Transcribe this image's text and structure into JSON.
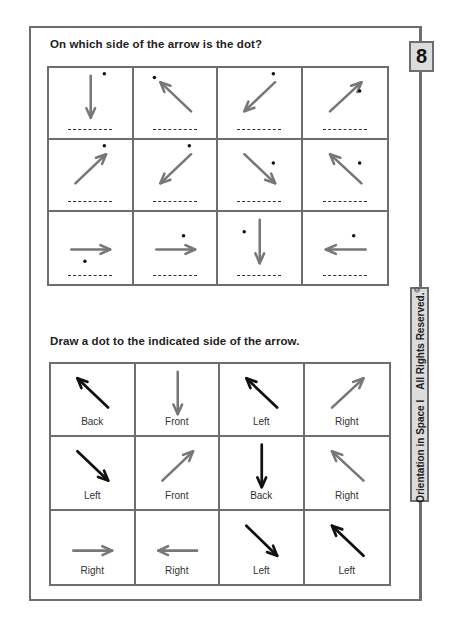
{
  "page_number": "8",
  "side_label": {
    "series": "Orientation in Space I",
    "rights": "All Rights Reserved.",
    "copyright_symbol": "©"
  },
  "colors": {
    "frame": "#6e6e6e",
    "arrow_gray": "#777777",
    "arrow_black": "#111111",
    "label_box_bg": "#dcdcdc"
  },
  "exercise1": {
    "title": "On which side of the arrow is the dot?",
    "answer_blank": "---------",
    "cells": [
      {
        "arrow": "down",
        "dot": "upper-right"
      },
      {
        "arrow": "up-left",
        "dot": "upper-left"
      },
      {
        "arrow": "down-left",
        "dot": "upper-right"
      },
      {
        "arrow": "up-right",
        "dot": "right"
      },
      {
        "arrow": "up-right",
        "dot": "upper-right"
      },
      {
        "arrow": "down-left",
        "dot": "upper-right"
      },
      {
        "arrow": "down-right",
        "dot": "right"
      },
      {
        "arrow": "up-left",
        "dot": "right"
      },
      {
        "arrow": "right",
        "dot": "below"
      },
      {
        "arrow": "right",
        "dot": "above"
      },
      {
        "arrow": "down",
        "dot": "left"
      },
      {
        "arrow": "left",
        "dot": "above"
      }
    ]
  },
  "exercise2": {
    "title": "Draw a dot to the indicated side of the arrow.",
    "cells": [
      {
        "arrow": "up-left",
        "color": "black",
        "label": "Back"
      },
      {
        "arrow": "down",
        "color": "gray",
        "label": "Front"
      },
      {
        "arrow": "up-left",
        "color": "black",
        "label": "Left"
      },
      {
        "arrow": "up-right",
        "color": "gray",
        "label": "Right"
      },
      {
        "arrow": "down-right",
        "color": "black",
        "label": "Left"
      },
      {
        "arrow": "up-right",
        "color": "gray",
        "label": "Front"
      },
      {
        "arrow": "down",
        "color": "black",
        "label": "Back"
      },
      {
        "arrow": "up-left",
        "color": "gray",
        "label": "Right"
      },
      {
        "arrow": "right",
        "color": "gray",
        "label": "Right"
      },
      {
        "arrow": "left",
        "color": "gray",
        "label": "Right"
      },
      {
        "arrow": "down-right",
        "color": "black",
        "label": "Left"
      },
      {
        "arrow": "up-left",
        "color": "black",
        "label": "Left"
      }
    ]
  }
}
